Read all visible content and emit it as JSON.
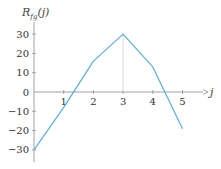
{
  "chart_data": {
    "type": "line",
    "title": "",
    "ylabel": "R_fg(j)",
    "ylabel_main": "R",
    "ylabel_sub": "fg",
    "ylabel_tail": "(j)",
    "xlabel": "j",
    "x": [
      0,
      1,
      2,
      3,
      4,
      5
    ],
    "series": [
      {
        "name": "R_fg(j)",
        "values": [
          -30,
          -8,
          16,
          30,
          13,
          -19
        ],
        "color": "#5aaed8"
      }
    ],
    "x_ticks": [
      "1",
      "2",
      "3",
      "4",
      "5"
    ],
    "y_ticks": [
      "30",
      "20",
      "10",
      "0",
      "−10",
      "−20",
      "−30"
    ],
    "y_tick_values": [
      30,
      20,
      10,
      0,
      -10,
      -20,
      -30
    ],
    "xlim": [
      0,
      5.6
    ],
    "ylim": [
      -35,
      35
    ],
    "grid": false,
    "annotations": [
      {
        "type": "vertical-guide",
        "x": 3,
        "from": 0,
        "to": 30,
        "color": "#d8d8d8"
      }
    ],
    "axis_color": "#888888"
  }
}
